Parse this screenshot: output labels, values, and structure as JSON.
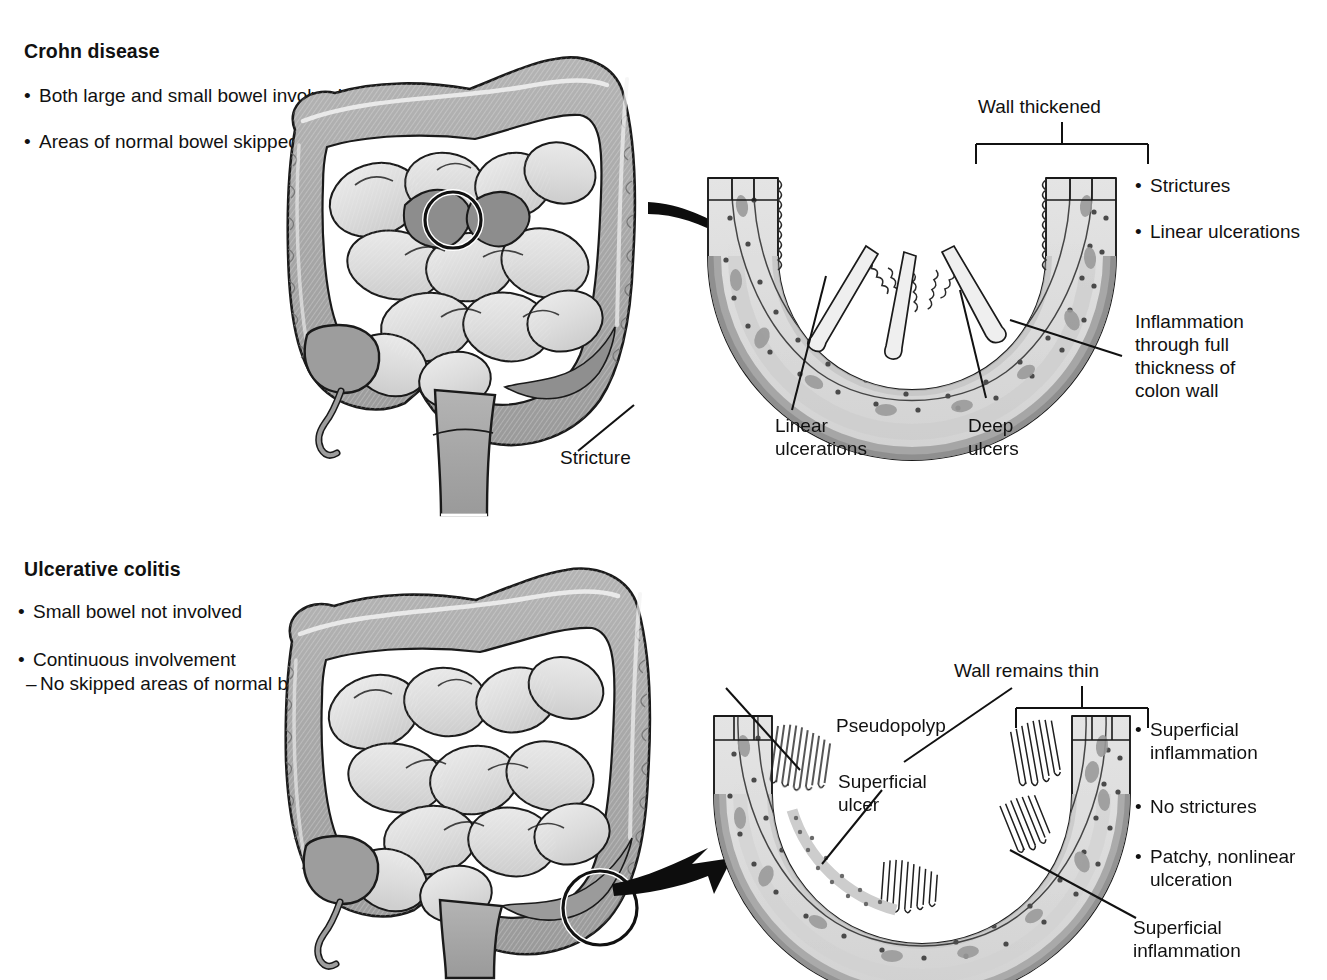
{
  "figure": {
    "kind": "medical-illustration"
  },
  "crohn": {
    "title": "Crohn disease",
    "left_bullets": [
      "Both large and small\nbowel involved",
      "Areas of normal\nbowel skipped"
    ],
    "colon_label": "Stricture",
    "cross_section": {
      "top_label": "Wall thickened",
      "right_bullets": [
        "Strictures",
        "Linear ulcerations"
      ],
      "right_callout": "Inflammation\nthrough full\nthickness of\ncolon wall",
      "bottom_labels": [
        "Linear\nulcerations",
        "Deep\nulcers"
      ]
    }
  },
  "ulcerative_colitis": {
    "title": "Ulcerative colitis",
    "left_bullets": [
      "Small bowel not\ninvolved",
      "Continuous\ninvolvement"
    ],
    "left_subbullet": "No skipped areas\n of normal bowel",
    "cross_section": {
      "top_label": "Wall remains thin",
      "labels": [
        "Pseudopolyp",
        "Superficial\nulcer"
      ],
      "right_bullets": [
        "Superficial\ninflammation",
        "No strictures",
        "Patchy, nonlinear\nulceration"
      ],
      "right_callout": "Superficial\ninflammation"
    }
  },
  "palette": {
    "ink": "#111111",
    "outline": "#1a1a1a",
    "colon_mid": "#a9a9a9",
    "colon_dark": "#8f8f8f",
    "small_bowel": "#d9d9d9",
    "small_bowel_light": "#e6e6e6",
    "wall_light": "#dcdcdc",
    "wall_mid": "#c2c2c2",
    "wall_dark": "#9d9d9d",
    "mucosa": "#bdbdbd",
    "paper": "#ffffff"
  }
}
